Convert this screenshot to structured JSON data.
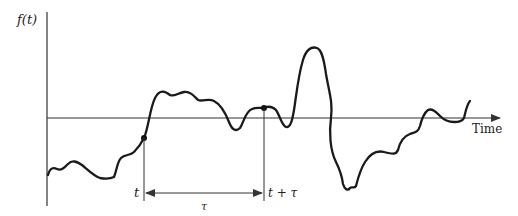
{
  "diagram": {
    "y_axis_label": "f(t)",
    "x_axis_label": "Time",
    "point_t_label": "t",
    "point_t_tau_label": "t + τ",
    "interval_label": "τ",
    "colors": {
      "line": "#1a1a1a",
      "axis": "#333333",
      "background": "#ffffff"
    }
  }
}
